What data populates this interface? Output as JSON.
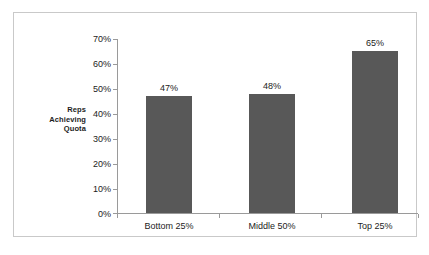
{
  "chart_data": {
    "type": "bar",
    "title": "",
    "subtitle": "",
    "xlabel": "",
    "ylabel": "Reps Achieving Quota",
    "ylabel_lines": [
      "Reps",
      "Achieving",
      "Quota"
    ],
    "categories": [
      "Bottom 25%",
      "Middle 50%",
      "Top 25%"
    ],
    "values": [
      47,
      48,
      65
    ],
    "value_labels": [
      "47%",
      "48%",
      "65%"
    ],
    "ylim": [
      0,
      70
    ],
    "ytick_values": [
      0,
      10,
      20,
      30,
      40,
      50,
      60,
      70
    ],
    "ytick_labels": [
      "0%",
      "10%",
      "20%",
      "30%",
      "40%",
      "50%",
      "60%",
      "70%"
    ],
    "grid": false,
    "legend": false,
    "legend_position": "none",
    "series": [
      {
        "name": "Reps Achieving Quota",
        "values": [
          47,
          48,
          65
        ],
        "color": "#585858"
      }
    ],
    "colors": {
      "bar": "#585858",
      "axis": "#9a9a9a",
      "frame": "#c9c9c9",
      "text": "#1c1c1c",
      "background": "#ffffff"
    }
  }
}
